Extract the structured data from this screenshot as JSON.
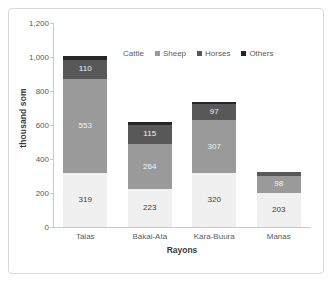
{
  "chart_data": {
    "type": "bar",
    "subtype": "stacked-column",
    "title": "",
    "xlabel": "Rayons",
    "ylabel": "thousand som",
    "ylim": [
      0,
      1200
    ],
    "ytick_labels": [
      "1,200",
      "1,000",
      "800",
      "600",
      "400",
      "200",
      "0"
    ],
    "ytick_values": [
      1200,
      1000,
      800,
      600,
      400,
      200,
      0
    ],
    "grid": false,
    "legend_position": "top-center",
    "categories": [
      "Talas",
      "Bakai-Ata",
      "Kara-Buura",
      "Manas"
    ],
    "series": [
      {
        "name": "Cattle",
        "color": "#f0f0f0",
        "values": [
          319,
          223,
          320,
          203
        ],
        "labels": [
          "319",
          "223",
          "320",
          "203"
        ]
      },
      {
        "name": "Sheep",
        "color": "#9a9a9a",
        "values": [
          553,
          264,
          307,
          98
        ],
        "labels": [
          "553",
          "264",
          "307",
          "98"
        ]
      },
      {
        "name": "Horses",
        "color": "#585858",
        "values": [
          110,
          115,
          97,
          20
        ],
        "labels": [
          "110",
          "115",
          "97",
          "20"
        ]
      },
      {
        "name": "Others",
        "color": "#262626",
        "values": [
          23,
          14,
          9,
          5
        ],
        "labels": [
          "23",
          "",
          "9",
          "5"
        ]
      }
    ],
    "totals": [
      1005,
      616,
      733,
      326
    ]
  },
  "legend": {
    "items": [
      {
        "label": "Cattle",
        "color": "#f0f0f0",
        "swatch_visible": false
      },
      {
        "label": "Sheep",
        "color": "#9a9a9a",
        "swatch_visible": true
      },
      {
        "label": "Horses",
        "color": "#585858",
        "swatch_visible": true
      },
      {
        "label": "Others",
        "color": "#262626",
        "swatch_visible": true
      }
    ]
  }
}
